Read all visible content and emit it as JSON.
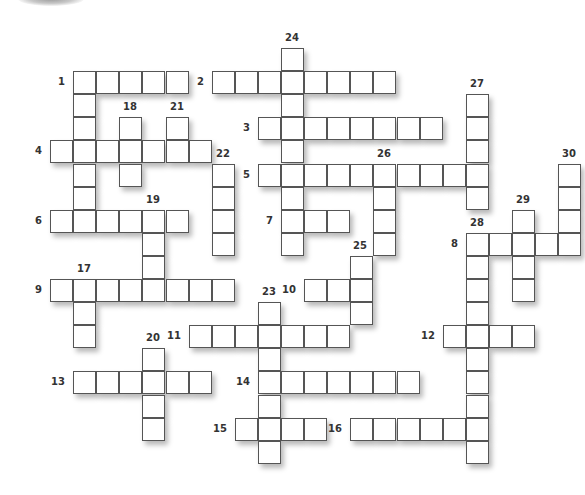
{
  "puzzle": {
    "type": "crossword",
    "grid": {
      "origin_x": 50,
      "origin_y": 48,
      "pitch": 23.1,
      "cell_size": 23
    },
    "colors": {
      "cell_fill": "#ffffff",
      "cell_border": "#555555",
      "label": "#333333"
    },
    "words": [
      {
        "number": "1",
        "direction": "across",
        "row": 1,
        "col": 1,
        "length": 5,
        "label_side": "left"
      },
      {
        "number": "1",
        "direction": "down",
        "row": 1,
        "col": 1,
        "length": 7,
        "label_side": "none"
      },
      {
        "number": "2",
        "direction": "across",
        "row": 1,
        "col": 7,
        "length": 8,
        "label_side": "left"
      },
      {
        "number": "3",
        "direction": "across",
        "row": 3,
        "col": 9,
        "length": 8,
        "label_side": "left"
      },
      {
        "number": "4",
        "direction": "across",
        "row": 4,
        "col": 0,
        "length": 7,
        "label_side": "left"
      },
      {
        "number": "5",
        "direction": "across",
        "row": 5,
        "col": 9,
        "length": 10,
        "label_side": "left"
      },
      {
        "number": "6",
        "direction": "across",
        "row": 7,
        "col": 0,
        "length": 6,
        "label_side": "left"
      },
      {
        "number": "7",
        "direction": "across",
        "row": 7,
        "col": 10,
        "length": 3,
        "label_side": "left"
      },
      {
        "number": "8",
        "direction": "across",
        "row": 8,
        "col": 18,
        "length": 5,
        "label_side": "left"
      },
      {
        "number": "9",
        "direction": "across",
        "row": 10,
        "col": 0,
        "length": 8,
        "label_side": "left"
      },
      {
        "number": "10",
        "direction": "across",
        "row": 10,
        "col": 11,
        "length": 3,
        "label_side": "left"
      },
      {
        "number": "11",
        "direction": "across",
        "row": 12,
        "col": 6,
        "length": 7,
        "label_side": "left"
      },
      {
        "number": "12",
        "direction": "across",
        "row": 12,
        "col": 17,
        "length": 4,
        "label_side": "left"
      },
      {
        "number": "13",
        "direction": "across",
        "row": 14,
        "col": 1,
        "length": 6,
        "label_side": "left"
      },
      {
        "number": "14",
        "direction": "across",
        "row": 14,
        "col": 9,
        "length": 7,
        "label_side": "left"
      },
      {
        "number": "15",
        "direction": "across",
        "row": 16,
        "col": 8,
        "length": 4,
        "label_side": "left"
      },
      {
        "number": "16",
        "direction": "across",
        "row": 16,
        "col": 13,
        "length": 6,
        "label_side": "left"
      },
      {
        "number": "17",
        "direction": "down",
        "row": 10,
        "col": 1,
        "length": 3,
        "label_side": "top"
      },
      {
        "number": "18",
        "direction": "down",
        "row": 3,
        "col": 3,
        "length": 3,
        "label_side": "top"
      },
      {
        "number": "19",
        "direction": "down",
        "row": 7,
        "col": 4,
        "length": 4,
        "label_side": "top"
      },
      {
        "number": "20",
        "direction": "down",
        "row": 13,
        "col": 4,
        "length": 4,
        "label_side": "top"
      },
      {
        "number": "21",
        "direction": "down",
        "row": 3,
        "col": 5,
        "length": 2,
        "label_side": "top"
      },
      {
        "number": "22",
        "direction": "down",
        "row": 5,
        "col": 7,
        "length": 4,
        "label_side": "top"
      },
      {
        "number": "23",
        "direction": "down",
        "row": 11,
        "col": 9,
        "length": 7,
        "label_side": "top"
      },
      {
        "number": "24",
        "direction": "down",
        "row": 0,
        "col": 10,
        "length": 9,
        "label_side": "top"
      },
      {
        "number": "25",
        "direction": "down",
        "row": 9,
        "col": 13,
        "length": 3,
        "label_side": "topleft"
      },
      {
        "number": "26",
        "direction": "down",
        "row": 5,
        "col": 14,
        "length": 4,
        "label_side": "top"
      },
      {
        "number": "27",
        "direction": "down",
        "row": 2,
        "col": 18,
        "length": 5,
        "label_side": "top"
      },
      {
        "number": "28",
        "direction": "down",
        "row": 8,
        "col": 18,
        "length": 10,
        "label_side": "top"
      },
      {
        "number": "29",
        "direction": "down",
        "row": 7,
        "col": 20,
        "length": 4,
        "label_side": "top"
      },
      {
        "number": "30",
        "direction": "down",
        "row": 5,
        "col": 22,
        "length": 4,
        "label_side": "top"
      }
    ],
    "entries": {}
  }
}
